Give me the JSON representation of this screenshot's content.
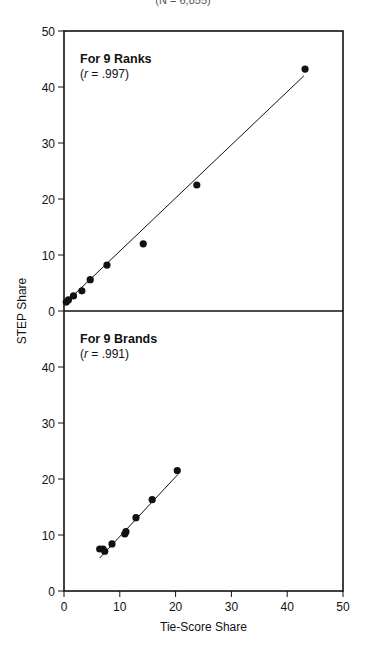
{
  "header": {
    "subtitle": "(N = 6,855)"
  },
  "chart_data": [
    {
      "type": "scatter",
      "title": "For 9 Ranks",
      "annotation": "(r = .997)",
      "r_label_prefix": "(",
      "r_symbol": "r",
      "r_value": " = .997)",
      "xlabel": "Tie-Score Share",
      "ylabel": "STEP Share",
      "xlim": [
        0,
        50
      ],
      "ylim": [
        0,
        50
      ],
      "x_ticks": [
        0,
        10,
        20,
        30,
        40,
        50
      ],
      "y_ticks": [
        0,
        10,
        20,
        30,
        40,
        50
      ],
      "grid": false,
      "points": [
        {
          "x": 0.4,
          "y": 1.6
        },
        {
          "x": 0.8,
          "y": 2.0
        },
        {
          "x": 1.7,
          "y": 2.7
        },
        {
          "x": 3.2,
          "y": 3.6
        },
        {
          "x": 4.7,
          "y": 5.6
        },
        {
          "x": 7.7,
          "y": 8.2
        },
        {
          "x": 14.2,
          "y": 12.0
        },
        {
          "x": 23.8,
          "y": 22.5
        },
        {
          "x": 43.2,
          "y": 43.2
        }
      ],
      "fit_line": {
        "x0": 0,
        "y0": 1.2,
        "x1": 43,
        "y1": 42.0
      }
    },
    {
      "type": "scatter",
      "title": "For 9 Brands",
      "annotation": "(r = .991)",
      "r_label_prefix": "(",
      "r_symbol": "r",
      "r_value": " = .991)",
      "xlabel": "Tie-Score Share",
      "ylabel": "STEP Share",
      "xlim": [
        0,
        50
      ],
      "ylim": [
        0,
        50
      ],
      "x_ticks": [
        0,
        10,
        20,
        30,
        40,
        50
      ],
      "y_ticks": [
        0,
        10,
        20,
        30,
        40,
        50
      ],
      "grid": false,
      "points": [
        {
          "x": 6.4,
          "y": 7.5
        },
        {
          "x": 7.0,
          "y": 7.5
        },
        {
          "x": 7.3,
          "y": 7.1
        },
        {
          "x": 8.6,
          "y": 8.4
        },
        {
          "x": 10.9,
          "y": 10.2
        },
        {
          "x": 11.1,
          "y": 10.6
        },
        {
          "x": 12.9,
          "y": 13.1
        },
        {
          "x": 15.8,
          "y": 16.3
        },
        {
          "x": 20.3,
          "y": 21.5
        }
      ],
      "fit_line": {
        "x0": 6.4,
        "y0": 5.9,
        "x1": 20.4,
        "y1": 20.8
      }
    }
  ],
  "axes": {
    "xlabel": "Tie-Score Share",
    "ylabel": "STEP Share",
    "x_tick_labels": [
      "0",
      "10",
      "20",
      "30",
      "40",
      "50"
    ],
    "y_tick_labels": [
      "0",
      "10",
      "20",
      "30",
      "40",
      "50"
    ]
  },
  "colors": {
    "ink": "#111111",
    "background": "#ffffff"
  }
}
